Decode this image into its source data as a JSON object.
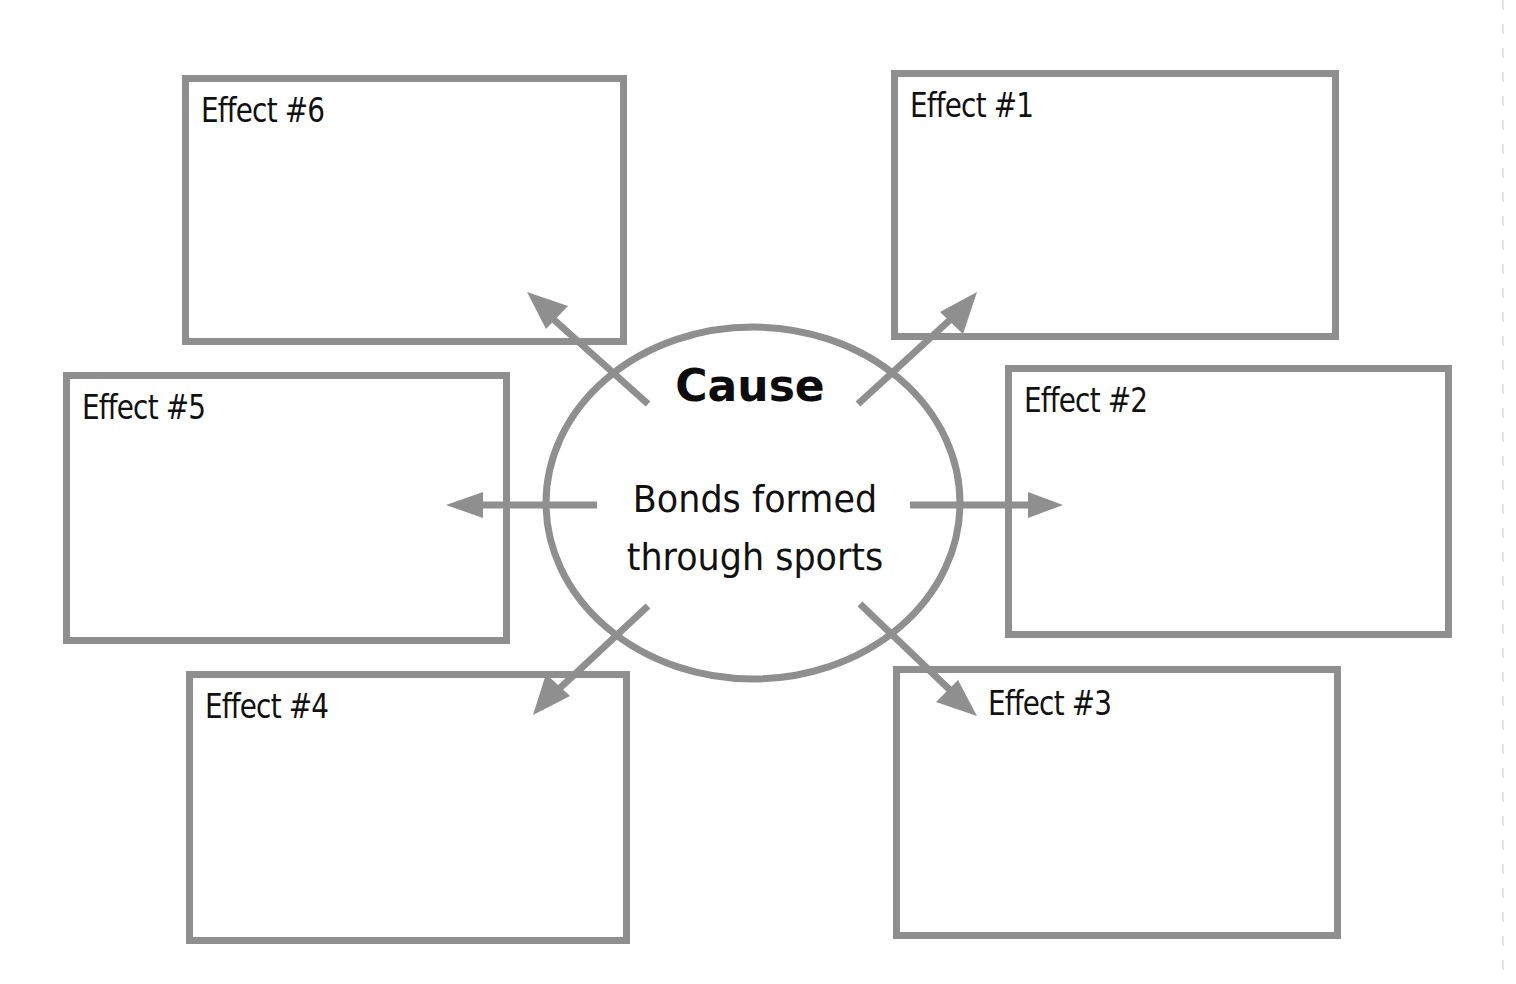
{
  "diagram": {
    "type": "cause-and-effect graphic organizer",
    "colors": {
      "stroke": "#8f8f8f",
      "text": "#111111",
      "background": "#ffffff"
    },
    "cause": {
      "heading": "Cause",
      "text_line1": "Bonds formed",
      "text_line2": "through sports"
    },
    "effects": [
      {
        "id": 1,
        "label": "Effect #1",
        "content": ""
      },
      {
        "id": 2,
        "label": "Effect #2",
        "content": ""
      },
      {
        "id": 3,
        "label": "Effect #3",
        "content": ""
      },
      {
        "id": 4,
        "label": "Effect #4",
        "content": ""
      },
      {
        "id": 5,
        "label": "Effect #5",
        "content": ""
      },
      {
        "id": 6,
        "label": "Effect #6",
        "content": ""
      }
    ]
  }
}
